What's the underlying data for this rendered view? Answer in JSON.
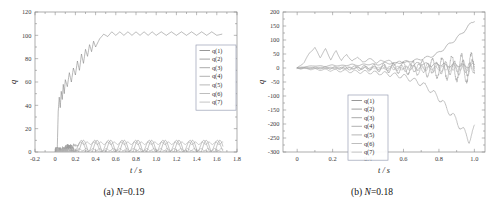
{
  "figure": {
    "panels": [
      {
        "id": "a",
        "caption_prefix": "(a) ",
        "caption_var": "N",
        "caption_value": "=0.19",
        "caption_full": "(a) N=0.19",
        "chart_data": {
          "type": "line",
          "title": "",
          "xlabel": "t / s",
          "ylabel": "q",
          "xlim": [
            -0.2,
            1.8
          ],
          "ylim": [
            0,
            120
          ],
          "xticks": [
            "-0.2",
            "0",
            "0.2",
            "0.4",
            "0.6",
            "0.8",
            "1.0",
            "1.2",
            "1.4",
            "1.6",
            "1.8"
          ],
          "xtick_values": [
            -0.2,
            0,
            0.2,
            0.4,
            0.6,
            0.8,
            1.0,
            1.2,
            1.4,
            1.6,
            1.8
          ],
          "yticks": [
            "0",
            "20",
            "40",
            "60",
            "80",
            "100",
            "120"
          ],
          "ytick_values": [
            0,
            20,
            40,
            60,
            80,
            100,
            120
          ],
          "grid": false,
          "legend_position": "upper-right",
          "legend": [
            "q(1)",
            "q(2)",
            "q(3)",
            "q(4)",
            "q(5)",
            "q(6)",
            "q(7)"
          ],
          "series": [
            {
              "name": "q(1)",
              "color": "#7d7d7d",
              "description": "rises steeply from 0 near t=0.03, oscillates upward, settles near 101 with small ripples",
              "x": [
                0.0,
                0.02,
                0.03,
                0.04,
                0.05,
                0.06,
                0.07,
                0.08,
                0.09,
                0.1,
                0.12,
                0.14,
                0.16,
                0.18,
                0.2,
                0.22,
                0.24,
                0.26,
                0.28,
                0.3,
                0.32,
                0.34,
                0.36,
                0.38,
                0.4,
                0.44,
                0.48,
                0.52,
                0.56,
                0.6,
                0.64,
                0.68,
                0.72,
                0.76,
                0.8,
                0.84,
                0.88,
                0.92,
                0.96,
                1.0,
                1.05,
                1.1,
                1.15,
                1.2,
                1.25,
                1.3,
                1.35,
                1.4,
                1.45,
                1.5,
                1.55,
                1.6,
                1.65
              ],
              "y": [
                0,
                1,
                35,
                47,
                38,
                52,
                45,
                58,
                50,
                62,
                56,
                68,
                60,
                72,
                66,
                78,
                70,
                84,
                76,
                88,
                82,
                92,
                86,
                95,
                90,
                97,
                101,
                99,
                103,
                100,
                103,
                100,
                103,
                100,
                103,
                100,
                103,
                100,
                103,
                100,
                103,
                100,
                103,
                100,
                103,
                100,
                103,
                100,
                103,
                100,
                103,
                100,
                101
              ]
            },
            {
              "name": "q(2)",
              "color": "#8c8c8c",
              "description": "low amplitude oscillation around 4, amplitude ~6",
              "amplitude": 6,
              "mean": 4,
              "period": 0.135
            },
            {
              "name": "q(3)",
              "color": "#959595",
              "description": "oscillation around 5, amplitude ~5, slight phase offset",
              "amplitude": 5,
              "mean": 5,
              "period": 0.135
            },
            {
              "name": "q(4)",
              "color": "#9e9e9e",
              "description": "near-flat line around 7.5 with tiny ripple",
              "amplitude": 1.1,
              "mean": 7.5,
              "period": 0.067
            },
            {
              "name": "q(5)",
              "color": "#a6a6a6",
              "description": "near-flat line around 2 with tiny ripple",
              "amplitude": 1.0,
              "mean": 2.0,
              "period": 0.067
            },
            {
              "name": "q(6)",
              "color": "#adadad",
              "description": "near-flat line around -1 with tiny ripple",
              "amplitude": 0.9,
              "mean": -1.0,
              "period": 0.067
            },
            {
              "name": "q(7)",
              "color": "#b5b5b5",
              "description": "near-flat line around 0.5 with tiny ripple",
              "amplitude": 0.8,
              "mean": 0.5,
              "period": 0.067
            }
          ]
        }
      },
      {
        "id": "b",
        "caption_prefix": "(b) ",
        "caption_var": "N",
        "caption_value": "=0.18",
        "caption_full": "(b) N=0.18",
        "chart_data": {
          "type": "line",
          "title": "",
          "xlabel": "t / s",
          "ylabel": "q",
          "xlim": [
            -0.08,
            1.06
          ],
          "ylim": [
            -300,
            200
          ],
          "xticks": [
            "0",
            "0.2",
            "0.4",
            "0.6",
            "0.8",
            "1.0"
          ],
          "xtick_values": [
            0,
            0.2,
            0.4,
            0.6,
            0.8,
            1.0
          ],
          "yticks": [
            "200",
            "150",
            "100",
            "50",
            "0",
            "-50",
            "-100",
            "-150",
            "-200",
            "-250",
            "-300"
          ],
          "ytick_values": [
            200,
            150,
            100,
            50,
            0,
            -50,
            -100,
            -150,
            -200,
            -250,
            -300
          ],
          "grid": false,
          "legend_position": "center",
          "legend": [
            "q(1)",
            "q(2)",
            "q(3)",
            "q(4)",
            "q(5)",
            "q(6)",
            "q(7)"
          ],
          "series": [
            {
              "name": "q(1)",
              "color": "#7d7d7d",
              "description": "oscillates near 0 then diverges upward after t=0.7 reaching about 170 at t=1.0",
              "x": [
                0,
                0.05,
                0.1,
                0.15,
                0.2,
                0.25,
                0.3,
                0.35,
                0.4,
                0.45,
                0.5,
                0.55,
                0.6,
                0.65,
                0.7,
                0.72,
                0.75,
                0.78,
                0.8,
                0.83,
                0.86,
                0.89,
                0.92,
                0.95,
                0.98,
                1.0
              ],
              "y": [
                0,
                5,
                8,
                6,
                10,
                8,
                12,
                10,
                14,
                12,
                18,
                16,
                22,
                26,
                32,
                36,
                40,
                48,
                55,
                70,
                86,
                100,
                118,
                138,
                158,
                170
              ]
            },
            {
              "name": "q(2)",
              "color": "#888888",
              "description": "large ripple peaking near 70 at t=0.1-0.25 then decays toward 0 and mixes",
              "x": [
                0,
                0.04,
                0.07,
                0.1,
                0.13,
                0.16,
                0.19,
                0.22,
                0.25,
                0.28,
                0.31,
                0.34,
                0.37,
                0.4,
                0.45,
                0.5,
                0.55,
                0.6,
                0.65,
                0.7,
                0.75,
                0.8,
                0.85,
                0.9,
                0.95,
                1.0
              ],
              "y": [
                0,
                20,
                55,
                72,
                38,
                68,
                30,
                62,
                26,
                50,
                22,
                42,
                18,
                34,
                20,
                28,
                16,
                24,
                12,
                18,
                10,
                14,
                8,
                12,
                6,
                10
              ]
            },
            {
              "name": "q(3)",
              "color": "#939393",
              "description": "oscillates about 0 with growing amplitude, diverges strongly negative reaching about -260 at t=0.97",
              "x": [
                0,
                0.1,
                0.2,
                0.3,
                0.4,
                0.5,
                0.6,
                0.65,
                0.7,
                0.74,
                0.78,
                0.82,
                0.85,
                0.88,
                0.91,
                0.94,
                0.97,
                1.0
              ],
              "y": [
                0,
                -5,
                -8,
                -12,
                -15,
                -20,
                -30,
                -42,
                -55,
                -72,
                -95,
                -120,
                -150,
                -170,
                -200,
                -225,
                -258,
                -215
              ]
            },
            {
              "name": "q(4)",
              "color": "#9c9c9c",
              "description": "moderate oscillation growing to roughly ±55 amplitude by t=1.0",
              "amplitude_start": 3,
              "amplitude_end": 55,
              "period": 0.055
            },
            {
              "name": "q(5)",
              "color": "#a5a5a5",
              "description": "small oscillation about 0 growing to ±30",
              "amplitude_start": 2,
              "amplitude_end": 30,
              "period": 0.05
            },
            {
              "name": "q(6)",
              "color": "#adadad",
              "description": "small oscillation about 0 growing to ±18",
              "amplitude_start": 2,
              "amplitude_end": 18,
              "period": 0.045
            },
            {
              "name": "q(7)",
              "color": "#b4b4b4",
              "description": "near flat about 0 with small ripple up to ±10",
              "amplitude_start": 1,
              "amplitude_end": 10,
              "period": 0.04
            }
          ]
        }
      }
    ]
  }
}
